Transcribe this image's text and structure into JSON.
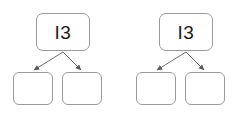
{
  "diagram": {
    "type": "binary-tree",
    "background_color": "#ffffff",
    "node_border_color": "#9a9a9a",
    "node_fill_color": "#ffffff",
    "edge_color": "#6e6e6e",
    "text_color": "#1a1a1a",
    "trees": [
      {
        "id": "tree-left",
        "root": {
          "label": "I3"
        },
        "children": [
          {
            "label": ""
          },
          {
            "label": ""
          }
        ]
      },
      {
        "id": "tree-right",
        "root": {
          "label": "I3"
        },
        "children": [
          {
            "label": ""
          },
          {
            "label": ""
          }
        ]
      }
    ]
  }
}
